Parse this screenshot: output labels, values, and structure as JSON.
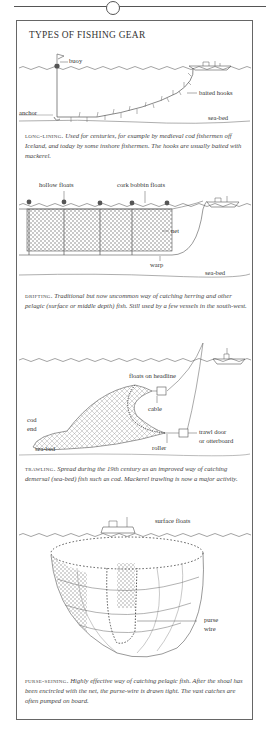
{
  "page": {
    "title": "TYPES OF FISHING GEAR"
  },
  "sections": [
    {
      "id": "long-lining",
      "heading": "long-lining.",
      "description": "Used for centuries, for example by medieval cod fishermen off Iceland, and today by some inshore fishermen. The hooks are usually baited with mackerel.",
      "labels": {
        "buoy": "buoy",
        "baited_hooks": "baited hooks",
        "anchor": "anchor",
        "sea_bed": "sea-bed"
      }
    },
    {
      "id": "drifting",
      "heading": "drifting.",
      "description": "Traditional but now uncommon way of catching herring and other pelagic (surface or middle depth) fish. Still used by a few vessels in the south-west.",
      "labels": {
        "hollow_floats": "hollow floats",
        "cork_bobbin_floats": "cork bobbin floats",
        "net": "net",
        "warp": "warp",
        "sea_bed": "sea-bed"
      }
    },
    {
      "id": "trawling",
      "heading": "trawling.",
      "description": "Spread during the 19th century as an improved way of catching demersal (sea-bed) fish such as cod. Mackerel trawling is now a major activity.",
      "labels": {
        "floats_on_headline": "floats on headline",
        "cable": "cable",
        "cod": "cod",
        "end": "end",
        "trawl_door": "trawl door",
        "otterboard": "or otterboard",
        "roller": "roller",
        "sea_bed": "sea-bed"
      }
    },
    {
      "id": "purse-seining",
      "heading": "purse-seining.",
      "description": "Highly effective way of catching pelagic fish. After the shoal has been encircled with the net, the purse-wire is drawn tight. The vast catches are often pumped on board.",
      "labels": {
        "surface_floats": "surface floats",
        "purse": "purse",
        "wire": "wire"
      }
    }
  ]
}
